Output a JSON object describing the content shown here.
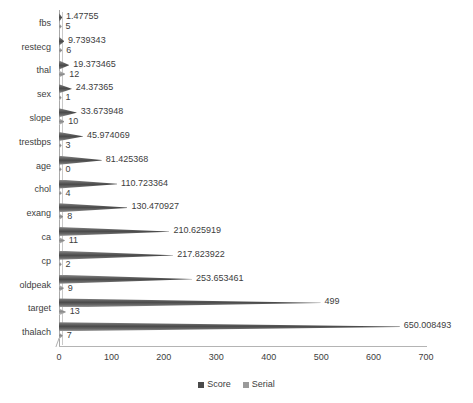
{
  "chart_data": {
    "type": "bar",
    "orientation": "horizontal",
    "subtype": "3d-cone",
    "title": "",
    "xlabel": "",
    "ylabel": "",
    "xlim": [
      0,
      700
    ],
    "xticks": [
      0,
      100,
      200,
      300,
      400,
      500,
      600,
      700
    ],
    "xticklabels": [
      "0",
      "100",
      "200",
      "300",
      "400",
      "500",
      "600",
      "700"
    ],
    "grid": false,
    "legend_position": "bottom-center",
    "categories": [
      "fbs",
      "restecg",
      "thal",
      "sex",
      "slope",
      "trestbps",
      "age",
      "chol",
      "exang",
      "ca",
      "cp",
      "oldpeak",
      "target",
      "thalach"
    ],
    "series": [
      {
        "name": "Score",
        "color": "#4a4a4a",
        "values": [
          1.47755,
          9.739343,
          19.373465,
          24.37365,
          33.673948,
          45.974069,
          81.425368,
          110.723364,
          130.470927,
          210.625919,
          217.823922,
          253.653461,
          499,
          650.008493
        ],
        "labels": [
          "1.47755",
          "9.739343",
          "19.373465",
          "24.37365",
          "33.673948",
          "45.974069",
          "81.425368",
          "110.723364",
          "130.470927",
          "210.625919",
          "217.823922",
          "253.653461",
          "499",
          "650.008493"
        ]
      },
      {
        "name": "Serial",
        "color": "#9a9a9a",
        "values": [
          5,
          6,
          12,
          1,
          10,
          3,
          0,
          4,
          8,
          11,
          2,
          9,
          13,
          7
        ],
        "labels": [
          "5",
          "6",
          "12",
          "1",
          "10",
          "3",
          "0",
          "4",
          "8",
          "11",
          "2",
          "9",
          "13",
          "7"
        ]
      }
    ]
  },
  "legend": {
    "items": [
      {
        "label": "Score",
        "color": "#4a4a4a"
      },
      {
        "label": "Serial",
        "color": "#9a9a9a"
      }
    ]
  },
  "colors": {
    "background": "#ffffff",
    "axis": "#b0b0b0",
    "text": "#3d3d3d",
    "score": "#4a4a4a",
    "serial": "#9a9a9a"
  }
}
